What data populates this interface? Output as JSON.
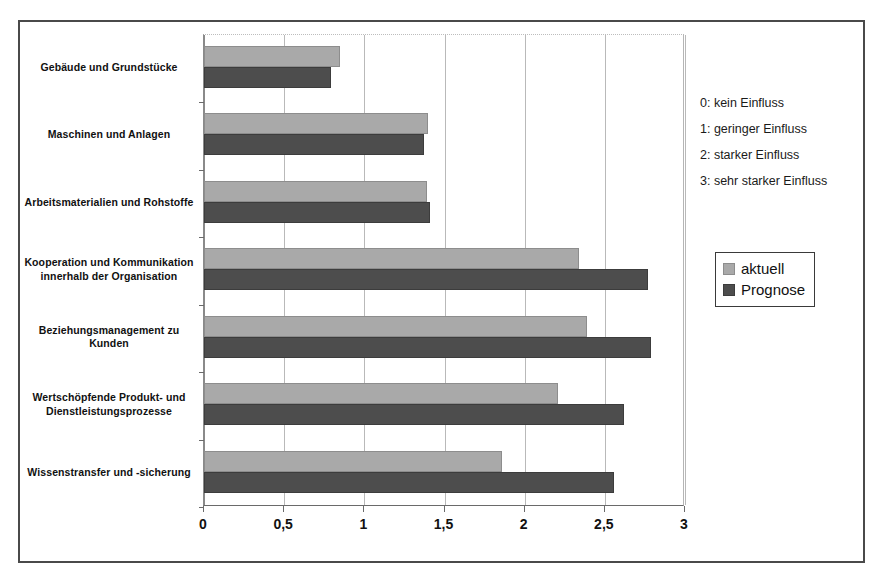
{
  "chart_data": {
    "type": "bar",
    "orientation": "horizontal",
    "title": "",
    "xlabel": "",
    "ylabel": "",
    "xlim": [
      0,
      3
    ],
    "xticks": [
      "0",
      "0,5",
      "1",
      "1,5",
      "2",
      "2,5",
      "3"
    ],
    "xtick_values": [
      0,
      0.5,
      1,
      1.5,
      2,
      2.5,
      3
    ],
    "grid": true,
    "legend_position": "right",
    "categories": [
      "Gebäude und Grundstücke",
      "Maschinen und Anlagen",
      "Arbeitsmaterialien und Rohstoffe",
      "Kooperation und Kommunikation innerhalb der Organisation",
      "Beziehungsmanagement zu Kunden",
      "Wertschöpfende Produkt- und Dienstleistungsprozesse",
      "Wissenstransfer und -sicherung"
    ],
    "series": [
      {
        "name": "aktuell",
        "color": "#a9a9a9",
        "values": [
          0.85,
          1.4,
          1.39,
          2.34,
          2.39,
          2.21,
          1.86
        ]
      },
      {
        "name": "Prognose",
        "color": "#4d4d4d",
        "values": [
          0.79,
          1.37,
          1.41,
          2.77,
          2.79,
          2.62,
          2.56
        ]
      }
    ]
  },
  "scale_key": {
    "lines": [
      "0: kein Einfluss",
      "1: geringer Einfluss",
      "2: starker Einfluss",
      "3: sehr starker Einfluss"
    ]
  },
  "legend": {
    "items": [
      {
        "label": "aktuell",
        "color": "#a9a9a9"
      },
      {
        "label": "Prognose",
        "color": "#4d4d4d"
      }
    ]
  }
}
